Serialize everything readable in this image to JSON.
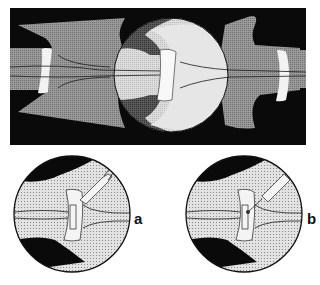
{
  "figure": {
    "top_panel": {
      "description": "Overview of spinal segment with magnified intervertebral joint (circle)",
      "colors": {
        "background": "#0a0a0a",
        "bone_gray": "#8c8c8c",
        "dark_gray": "#4a4a4a",
        "light_gray": "#d4d4d4",
        "disc_white": "#f2f2f2"
      }
    },
    "panels": [
      {
        "id": "a",
        "label": "a",
        "description": "Magnified joint with forked instrument"
      },
      {
        "id": "b",
        "label": "b",
        "description": "Magnified joint with needle instrument"
      }
    ]
  }
}
